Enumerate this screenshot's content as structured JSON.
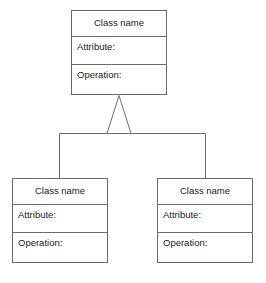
{
  "diagram": {
    "type": "uml-class-diagram",
    "title": "",
    "background_color": "#ffffff",
    "stroke_color": "#6b6b6b",
    "text_color": "#1a1a1a",
    "fill_color": "#ffffff",
    "relationship": {
      "kind": "generalization",
      "label": "",
      "arrowhead": "hollow-triangle",
      "arrowhead_fill": "#ffffff"
    },
    "classes": [
      {
        "role": "parent",
        "name": "Class name",
        "attributes_label": "Attribute:",
        "operations_label": "Operation:",
        "x": 71,
        "y": 10,
        "width": 96,
        "height": 85
      },
      {
        "role": "child-left",
        "name": "Class name",
        "attributes_label": "Attribute:",
        "operations_label": "Operation:",
        "x": 12,
        "y": 178,
        "width": 96,
        "height": 85
      },
      {
        "role": "child-right",
        "name": "Class name",
        "attributes_label": "Attribute:",
        "operations_label": "Operation:",
        "x": 157,
        "y": 178,
        "width": 96,
        "height": 85
      }
    ]
  }
}
